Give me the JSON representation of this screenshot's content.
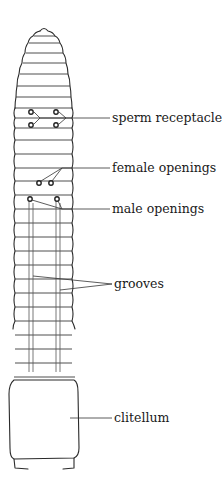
{
  "figure": {
    "colors": {
      "line": "#2a2a2a",
      "background": "#ffffff",
      "text": "#1a1a1a"
    },
    "labels": [
      {
        "id": "sperm-receptacles",
        "text": "sperm receptacles"
      },
      {
        "id": "female-openings",
        "text": "female openings"
      },
      {
        "id": "male-openings",
        "text": "male openings"
      },
      {
        "id": "grooves",
        "text": "grooves"
      },
      {
        "id": "clitellum",
        "text": "clitellum"
      }
    ]
  }
}
